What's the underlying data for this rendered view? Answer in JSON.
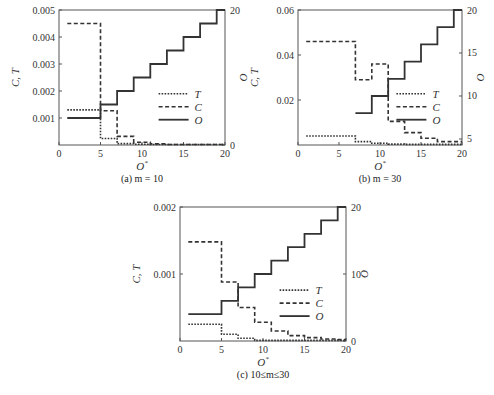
{
  "chart_data": [
    {
      "type": "line",
      "step": true,
      "caption": "(a) m = 10",
      "xlabel": "O*",
      "ylabel_left": "C, T",
      "ylabel_right": "O",
      "xlim": [
        0,
        20
      ],
      "ylim_left": [
        0,
        0.005
      ],
      "ylim_right": [
        0,
        20
      ],
      "xticks": [
        0,
        5,
        10,
        15,
        20
      ],
      "yticks_left": [
        0.001,
        0.002,
        0.003,
        0.004,
        0.005
      ],
      "yticks_left_labels": [
        "0.001",
        "0.002",
        "0.003",
        "0.004",
        "0.005"
      ],
      "yticks_right": [
        0,
        20
      ],
      "legend": [
        "T",
        "C",
        "O"
      ],
      "legend_position": "center-right",
      "series": [
        {
          "name": "T",
          "axis": "left",
          "style": "dotted",
          "x": [
            1,
            5,
            7,
            9,
            11,
            13,
            15,
            17,
            19,
            20
          ],
          "values": [
            0.0013,
            0.00024,
            5e-05,
            3e-05,
            2e-05,
            1e-05,
            1e-05,
            1e-05,
            1e-05,
            1e-05
          ]
        },
        {
          "name": "C",
          "axis": "left",
          "style": "dashed",
          "x": [
            1,
            5,
            7,
            9,
            11,
            13,
            15,
            17,
            19,
            20
          ],
          "values": [
            0.0045,
            0.00127,
            0.00032,
            0.0001,
            4e-05,
            2e-05,
            1e-05,
            1e-05,
            1e-05,
            1e-05
          ]
        },
        {
          "name": "O",
          "axis": "right",
          "style": "solid",
          "x": [
            1,
            5,
            7,
            9,
            11,
            13,
            15,
            17,
            19,
            20
          ],
          "values": [
            4,
            6,
            8,
            10,
            12,
            14,
            16,
            18,
            20,
            20
          ]
        }
      ]
    },
    {
      "type": "line",
      "step": true,
      "caption": "(b) m = 30",
      "xlabel": "O*",
      "ylabel_left": "C, T",
      "ylabel_right": "O",
      "xlim": [
        0,
        20
      ],
      "ylim_left": [
        0,
        0.06
      ],
      "ylim_right": [
        4.3,
        20
      ],
      "xticks": [
        0,
        5,
        10,
        15,
        20
      ],
      "yticks_left": [
        0.02,
        0.04,
        0.06
      ],
      "yticks_left_labels": [
        "0.02",
        "0.04",
        "0.06"
      ],
      "yticks_right": [
        5,
        10,
        15,
        20
      ],
      "legend": [
        "T",
        "C",
        "O"
      ],
      "legend_position": "center-right",
      "series": [
        {
          "name": "T",
          "axis": "left",
          "style": "dotted",
          "x": [
            1,
            7,
            9,
            11,
            13,
            15,
            17,
            19,
            20
          ],
          "values": [
            0.004,
            0.0015,
            0.0008,
            0.0004,
            0.0003,
            0.0003,
            0.0003,
            0.0003,
            0.0003
          ]
        },
        {
          "name": "C",
          "axis": "left",
          "style": "dashed",
          "x": [
            1,
            7,
            9,
            11,
            13,
            15,
            17,
            20
          ],
          "values": [
            0.046,
            0.029,
            0.036,
            0.0105,
            0.0055,
            0.003,
            0.0015,
            0.0015
          ]
        },
        {
          "name": "O",
          "axis": "right",
          "style": "solid",
          "x": [
            7,
            9,
            11,
            13,
            15,
            17,
            19,
            20
          ],
          "values": [
            8,
            10,
            12,
            14,
            16,
            18,
            20,
            20
          ]
        }
      ]
    },
    {
      "type": "line",
      "step": true,
      "caption": "(c) 10≤m≤30",
      "xlabel": "O*",
      "ylabel_left": "C, T",
      "ylabel_right": "O",
      "xlim": [
        0,
        20
      ],
      "ylim_left": [
        0,
        0.002
      ],
      "ylim_right": [
        0,
        20
      ],
      "xticks": [
        0,
        5,
        10,
        15,
        20
      ],
      "yticks_left": [
        0.001,
        0.002
      ],
      "yticks_left_labels": [
        "0.001",
        "0.002"
      ],
      "yticks_right": [
        0,
        10,
        20
      ],
      "legend": [
        "T",
        "C",
        "O"
      ],
      "legend_position": "center-right",
      "series": [
        {
          "name": "T",
          "axis": "left",
          "style": "dotted",
          "x": [
            1,
            5,
            7,
            9,
            11,
            13,
            15,
            17,
            19,
            20
          ],
          "values": [
            0.00025,
            0.0001,
            4e-05,
            1e-05,
            1e-05,
            1e-05,
            1e-05,
            1e-05,
            1e-05,
            1e-05
          ]
        },
        {
          "name": "C",
          "axis": "left",
          "style": "dashed",
          "x": [
            1,
            5,
            7,
            9,
            11,
            13,
            15,
            17,
            19,
            20
          ],
          "values": [
            0.00148,
            0.00088,
            0.0005,
            0.00028,
            0.00015,
            8e-05,
            5e-05,
            3e-05,
            2e-05,
            2e-05
          ]
        },
        {
          "name": "O",
          "axis": "right",
          "style": "solid",
          "x": [
            1,
            5,
            7,
            9,
            11,
            13,
            15,
            17,
            19,
            20
          ],
          "values": [
            4,
            6,
            8,
            10,
            12,
            14,
            16,
            18,
            20,
            20
          ]
        }
      ]
    }
  ],
  "panels": {
    "a": {
      "caption": "(a) m = 10",
      "xlabel": "O",
      "xlabel_sup": "*",
      "ylabel_left": "C, T",
      "ylabel_right": "O"
    },
    "b": {
      "caption": "(b) m = 30",
      "xlabel": "O",
      "xlabel_sup": "*",
      "ylabel_left": "C, T",
      "ylabel_right": "O"
    },
    "c": {
      "caption": "(c) 10≤m≤30",
      "xlabel": "O",
      "xlabel_sup": "*",
      "ylabel_left": "C, T",
      "ylabel_right": "O"
    }
  }
}
